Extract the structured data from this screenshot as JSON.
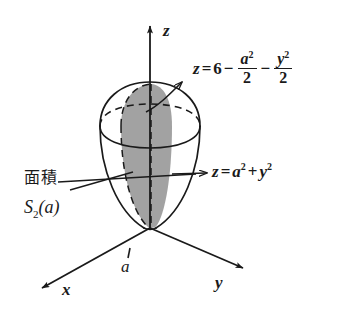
{
  "figure": {
    "background_color": "#ffffff",
    "ink_color": "#1a1a1a",
    "shade_color": "#9a9a9a"
  },
  "axes": [
    {
      "name": "z-axis",
      "label": "z",
      "direction": "up"
    },
    {
      "name": "x-axis",
      "label": "x",
      "direction": "down-left"
    },
    {
      "name": "y-axis",
      "label": "y",
      "direction": "down-right"
    }
  ],
  "ticks": [
    {
      "name": "x-tick-a",
      "label": "a",
      "axis": "x"
    }
  ],
  "annotations": {
    "upper_surface": {
      "lead": "z",
      "equals": "=",
      "constant": "6",
      "minus1": "−",
      "term1_num": "a",
      "term1_exp": "2",
      "term1_den": "2",
      "minus2": "−",
      "term2_num": "y",
      "term2_exp": "2",
      "term2_den": "2",
      "plain": "z = 6 − a²/2 − y²/2"
    },
    "lower_surface": {
      "lead": "z",
      "equals": "=",
      "term1": "a",
      "term1_exp": "2",
      "plus": "+",
      "term2": "y",
      "term2_exp": "2",
      "plain": "z = a² + y²"
    },
    "area_label": {
      "line1": "面積",
      "fn_name": "S",
      "fn_sub": "2",
      "fn_arg": "(a)",
      "plain": "面積 S₂(a)"
    }
  }
}
